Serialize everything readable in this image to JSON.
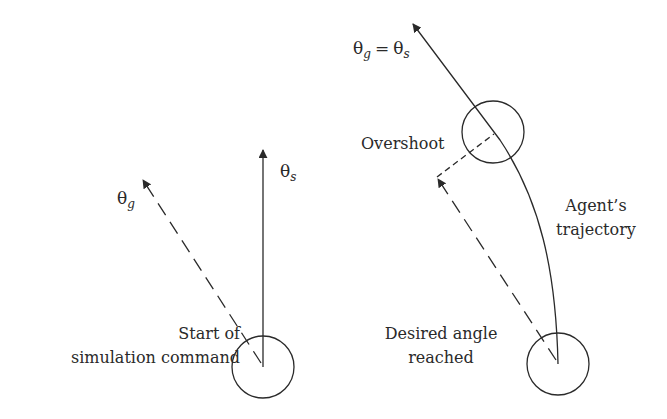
{
  "diagram": {
    "type": "agent-heading-overshoot",
    "colors": {
      "stroke": "#2a2a2a",
      "background": "#ffffff"
    },
    "left_panel": {
      "symbols": {
        "theta_g": {
          "base": "θ",
          "subscript": "g"
        },
        "theta_s": {
          "base": "θ",
          "subscript": "s"
        }
      },
      "caption_lines": [
        "Start of",
        "simulation command"
      ],
      "elements": {
        "agent_circle": "agent-start-position",
        "solid_arrow": "current-heading θs",
        "dashed_arrow": "goal-heading θg"
      }
    },
    "right_panel": {
      "equation": {
        "lhs_base": "θ",
        "lhs_sub": "g",
        "op": "=",
        "rhs_base": "θ",
        "rhs_sub": "s"
      },
      "overshoot_label": "Overshoot",
      "trajectory_label_lines": [
        "Agent’s",
        "trajectory"
      ],
      "desired_label_lines": [
        "Desired angle",
        "reached"
      ],
      "elements": {
        "start_circle": "agent-start-position",
        "overshoot_circle": "agent-overshoot-position",
        "trajectory_curve": "agent-trajectory",
        "dashed_arrow": "desired-heading",
        "dashed_connector": "overshoot-offset"
      }
    }
  }
}
